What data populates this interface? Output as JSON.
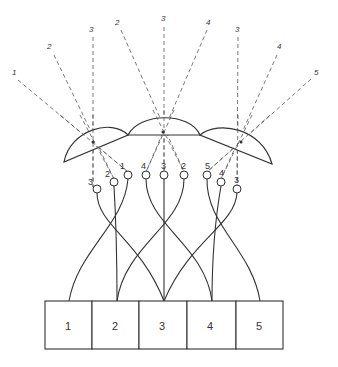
{
  "diagram": {
    "ray_labels": [
      {
        "id": "r1",
        "text": "1",
        "x": 14,
        "y": 73
      },
      {
        "id": "r2",
        "text": "2",
        "x": 50,
        "y": 46
      },
      {
        "id": "r3",
        "text": "3",
        "x": 92,
        "y": 29
      },
      {
        "id": "r4",
        "text": "2",
        "x": 118,
        "y": 22
      },
      {
        "id": "r5",
        "text": "3",
        "x": 164,
        "y": 18
      },
      {
        "id": "r6",
        "text": "4",
        "x": 208,
        "y": 22
      },
      {
        "id": "r7",
        "text": "3",
        "x": 237,
        "y": 29
      },
      {
        "id": "r8",
        "text": "4",
        "x": 279,
        "y": 46
      },
      {
        "id": "r9",
        "text": "5",
        "x": 316,
        "y": 72
      }
    ],
    "lenses": [
      "left-lens",
      "middle-lens",
      "right-lens"
    ],
    "receptor_groups": [
      {
        "name": "left",
        "labels": [
          "3",
          "2",
          "1"
        ]
      },
      {
        "name": "middle",
        "labels": [
          "4",
          "3",
          "2"
        ]
      },
      {
        "name": "right",
        "labels": [
          "5",
          "4",
          "3"
        ]
      }
    ],
    "cartridges": [
      "1",
      "2",
      "3",
      "4",
      "5"
    ]
  }
}
